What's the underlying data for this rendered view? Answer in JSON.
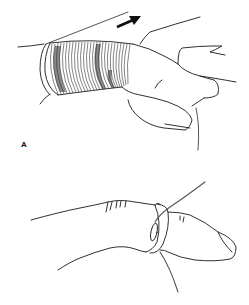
{
  "figure": {
    "style": "black-and-white medical line illustration",
    "background_color": "#ffffff",
    "line_color": "#1a1a1a",
    "string_color": "#555555",
    "panels": [
      {
        "label": "A",
        "description": "Finger tightly wrapped with string distal to ring; arrow indicating direction of pull toward fingertip",
        "arrow_direction": "up-right"
      },
      {
        "label": "B",
        "description": "Ring on finger with string end passed beneath the ring and pulled to unwind"
      }
    ]
  }
}
